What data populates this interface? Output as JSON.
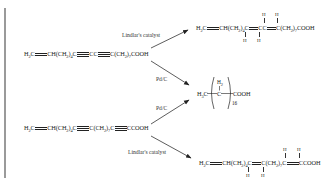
{
  "diagram": {
    "type": "reaction-scheme",
    "reactants": [
      {
        "id": "reactant-1",
        "formula": "H2C=CH(CH2)4C≡CC≡C(CH2)7COOH",
        "parts": {
          "a": "H",
          "a_sub": "2",
          "b": "C",
          "c": "CH(CH",
          "c_sub": "2",
          "d": ")",
          "d_sub": "4",
          "e": "C",
          "f": "CC",
          "g": "C(CH",
          "g_sub": "2",
          "h": ")",
          "h_sub": "7",
          "i": "COOH"
        }
      },
      {
        "id": "reactant-2",
        "formula": "H2C=CH(CH2)4C≡C(CH2)7C≡CCOOH",
        "parts": {
          "a": "H",
          "a_sub": "2",
          "b": "C",
          "c": "CH(CH",
          "c_sub": "2",
          "d": ")",
          "d_sub": "4",
          "e": "C",
          "f": "C(CH",
          "f_sub": "2",
          "g": ")",
          "g_sub": "7",
          "h": "C",
          "i": "CCOOH"
        }
      }
    ],
    "reactions": [
      {
        "from": "reactant-1",
        "to": "product-1",
        "catalyst": "Lindlar's catalyst"
      },
      {
        "from": "reactant-1",
        "to": "product-2",
        "catalyst": "Pd/C"
      },
      {
        "from": "reactant-2",
        "to": "product-2",
        "catalyst": "Pd/C"
      },
      {
        "from": "reactant-2",
        "to": "product-3",
        "catalyst": "Lindlar's catalyst"
      }
    ],
    "products": [
      {
        "id": "product-1",
        "formula": "H2C=CH(CH2)4CH=CHCH=CH(CH2)7COOH",
        "parts": {
          "a": "H",
          "a_sub": "2",
          "b": "C",
          "c": "CH(CH",
          "c_sub": "2",
          "d": ")",
          "d_sub": "4",
          "e": "C",
          "f": "CC",
          "g": "C(CH",
          "g_sub": "2",
          "h": ")",
          "h_sub": "7",
          "i": "COOH",
          "h_atom": "H"
        }
      },
      {
        "id": "product-2",
        "formula": "H3C(CH2)16COOH",
        "parts": {
          "a": "H",
          "a_sub": "3",
          "b": "C",
          "c": "C",
          "h2": "H",
          "h2_sub": "2",
          "n": "16",
          "d": "COOH"
        }
      },
      {
        "id": "product-3",
        "formula": "H2C=CH(CH2)4CH=CH(CH2)7CH=CHCOOH",
        "parts": {
          "a": "H",
          "a_sub": "2",
          "b": "C",
          "c": "CH(CH",
          "c_sub": "2",
          "d": ")",
          "d_sub": "4",
          "e": "C",
          "f": "C(CH",
          "f_sub": "2",
          "g": ")",
          "g_sub": "7",
          "h": "C",
          "i": "CCOOH",
          "h_atom": "H"
        }
      }
    ],
    "catalysts": {
      "lindlar": "Lindlar's catalyst",
      "pdc": "Pd/C"
    }
  }
}
